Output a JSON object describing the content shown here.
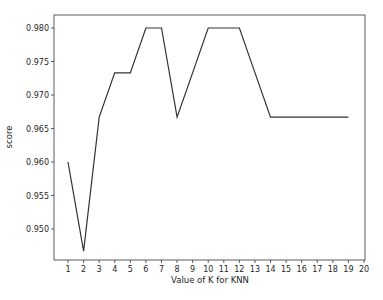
{
  "chart_data": {
    "type": "line",
    "title": "",
    "xlabel": "Value of K for KNN",
    "ylabel": "score",
    "x": [
      1,
      2,
      3,
      4,
      5,
      6,
      7,
      8,
      9,
      10,
      11,
      12,
      13,
      14,
      15,
      16,
      17,
      18,
      19
    ],
    "series": [
      {
        "name": "score",
        "color": "#333333",
        "values": [
          0.96,
          0.9467,
          0.9667,
          0.9733,
          0.9733,
          0.98,
          0.98,
          0.9667,
          0.9733,
          0.98,
          0.98,
          0.98,
          0.9733,
          0.9667,
          0.9667,
          0.9667,
          0.9667,
          0.9667,
          0.9667
        ]
      }
    ],
    "xticks": [
      1,
      2,
      3,
      4,
      5,
      6,
      7,
      8,
      9,
      10,
      11,
      12,
      13,
      14,
      15,
      16,
      17,
      18,
      19,
      20
    ],
    "yticks": [
      0.95,
      0.955,
      0.96,
      0.965,
      0.97,
      0.975,
      0.98
    ],
    "ytick_labels": [
      "0.950",
      "0.955",
      "0.960",
      "0.965",
      "0.970",
      "0.975",
      "0.980"
    ],
    "xlim": [
      0.1,
      20.0
    ],
    "ylim": [
      0.9453,
      0.982
    ],
    "grid": false,
    "legend": null
  }
}
